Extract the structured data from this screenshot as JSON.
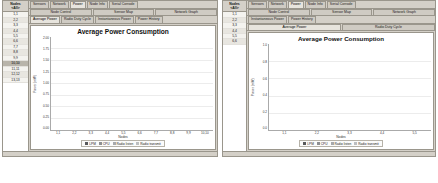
{
  "left_window": {
    "sidebar": {
      "header_line1": "Nodes",
      "header_line2": "<All>",
      "items": [
        {
          "label": "1,1",
          "selected": false
        },
        {
          "label": "2,2",
          "selected": false
        },
        {
          "label": "3,3",
          "selected": false
        },
        {
          "label": "4,4",
          "selected": false
        },
        {
          "label": "5,5",
          "selected": false
        },
        {
          "label": "6,6",
          "selected": false
        },
        {
          "label": "7,7",
          "selected": false
        },
        {
          "label": "8,8",
          "selected": false
        },
        {
          "label": "9,9",
          "selected": false
        },
        {
          "label": "10,10",
          "selected": true
        },
        {
          "label": "11,11",
          "selected": false
        },
        {
          "label": "12,12",
          "selected": false
        },
        {
          "label": "13,13",
          "selected": false
        }
      ]
    },
    "tab_row_1": [
      {
        "label": "Sensors",
        "active": false
      },
      {
        "label": "Network",
        "active": false
      },
      {
        "label": "Power",
        "active": true
      },
      {
        "label": "Node Info",
        "active": false
      },
      {
        "label": "Serial Console",
        "active": false
      }
    ],
    "tab_row_2": [
      {
        "label": "Node Control",
        "active": false
      },
      {
        "label": "Sensor Map",
        "active": false
      },
      {
        "label": "Network Graph",
        "active": false
      }
    ],
    "tab_row_3": [
      {
        "label": "Average Power",
        "active": true
      },
      {
        "label": "Radio Duty Cycle",
        "active": false
      },
      {
        "label": "Instantaneous Power",
        "active": false
      },
      {
        "label": "Power History",
        "active": false
      }
    ],
    "chart_data": {
      "type": "bar",
      "title": "Average Power Consumption",
      "xlabel": "Nodes",
      "ylabel": "Power (mW)",
      "ylim": [
        0,
        2.0
      ],
      "yticks": [
        "2.00",
        "1.75",
        "1.50",
        "1.25",
        "1.00",
        "0.75",
        "0.50",
        "0.25",
        "0.00"
      ],
      "grid": true,
      "stacked": true,
      "legend_position": "bottom",
      "categories": [
        "1,1",
        "2,2",
        "3,3",
        "4,4",
        "5,5",
        "6,6",
        "7,7",
        "8,8",
        "9,9",
        "10,10"
      ],
      "series": [
        {
          "name": "LPM",
          "color": "#58595b",
          "values": [
            0.15,
            0.15,
            0.15,
            0.15,
            0.15,
            0.15,
            0.15,
            0.15,
            0.15,
            0.15
          ]
        },
        {
          "name": "CPU",
          "color": "#8d8f92",
          "values": [
            0.22,
            0.2,
            0.21,
            0.22,
            0.2,
            0.21,
            0.22,
            0.21,
            0.2,
            0.22
          ]
        },
        {
          "name": "Radio listen",
          "color": "#a7a9ac",
          "values": [
            1.18,
            1.14,
            1.16,
            1.2,
            1.15,
            1.17,
            1.19,
            1.16,
            1.14,
            1.18
          ]
        },
        {
          "name": "Radio transmit",
          "color": "#bcbec0",
          "values": [
            0.17,
            0.14,
            0.15,
            0.16,
            0.14,
            0.15,
            0.16,
            0.15,
            0.14,
            0.16
          ]
        }
      ]
    }
  },
  "right_window": {
    "sidebar": {
      "header_line1": "Nodes",
      "header_line2": "<All>",
      "items": [
        {
          "label": "1,1",
          "selected": false
        },
        {
          "label": "2,2",
          "selected": false
        },
        {
          "label": "3,3",
          "selected": false
        },
        {
          "label": "4,4",
          "selected": false
        },
        {
          "label": "5,5",
          "selected": false
        },
        {
          "label": "6,6",
          "selected": false
        }
      ]
    },
    "tab_row_1": [
      {
        "label": "Sensors",
        "active": false
      },
      {
        "label": "Network",
        "active": false
      },
      {
        "label": "Power",
        "active": true
      },
      {
        "label": "Node Info",
        "active": false
      },
      {
        "label": "Serial Console",
        "active": false
      }
    ],
    "tab_row_2": [
      {
        "label": "Node Control",
        "active": false
      },
      {
        "label": "Sensor Map",
        "active": false
      },
      {
        "label": "Network Graph",
        "active": false
      }
    ],
    "tab_row_3": [
      {
        "label": "Instantaneous Power",
        "active": false
      },
      {
        "label": "Power History",
        "active": false
      }
    ],
    "tab_row_4": [
      {
        "label": "Average Power",
        "active": true
      },
      {
        "label": "Radio Duty Cycle",
        "active": false
      }
    ],
    "chart_data": {
      "type": "bar",
      "title": "Average Power Consumption",
      "xlabel": "Nodes",
      "ylabel": "Power (mW)",
      "ylim": [
        0,
        1.0
      ],
      "yticks": [
        "1.0",
        "0.8",
        "0.6",
        "0.4",
        "0.2",
        "0.0"
      ],
      "grid": true,
      "stacked": true,
      "legend_position": "bottom",
      "categories": [
        "1,1",
        "2,2",
        "3,3",
        "4,4",
        "5,5"
      ],
      "series": [
        {
          "name": "LPM",
          "color": "#58595b",
          "values": [
            0.1,
            0.1,
            0.1,
            0.1,
            0.1
          ]
        },
        {
          "name": "CPU",
          "color": "#8d8f92",
          "values": [
            0.14,
            0.12,
            0.15,
            0.16,
            0.13
          ]
        },
        {
          "name": "Radio listen",
          "color": "#a7a9ac",
          "values": [
            0.52,
            0.39,
            0.56,
            0.62,
            0.42
          ]
        },
        {
          "name": "Radio transmit",
          "color": "#bcbec0",
          "values": [
            0.08,
            0.05,
            0.09,
            0.1,
            0.06
          ]
        }
      ]
    }
  },
  "legend": {
    "items": [
      {
        "label": "LPM",
        "color": "#58595b"
      },
      {
        "label": "CPU",
        "color": "#8d8f92"
      },
      {
        "label": "Radio listen",
        "color": "#a7a9ac"
      },
      {
        "label": "Radio transmit",
        "color": "#bcbec0"
      }
    ]
  }
}
